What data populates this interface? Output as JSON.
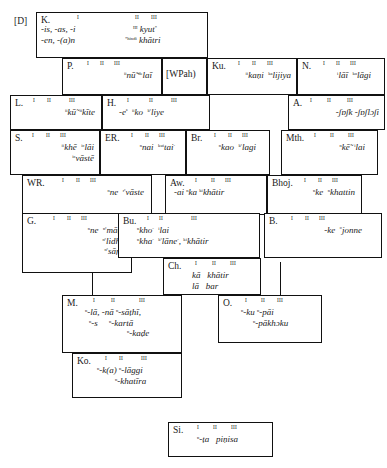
{
  "diagram": {
    "kind": "dialect-continuum-isogloss-chart",
    "column_headings": [
      "I",
      "II",
      "III"
    ],
    "tags": [
      {
        "id": "D",
        "label": "[D]"
      },
      {
        "id": "WPah",
        "label": "[WPah)"
      }
    ],
    "cells": [
      {
        "id": "K",
        "label": "K.",
        "numerals": [
          "I",
          "II",
          "III"
        ],
        "lines": [
          {
            "left": "-is, -as, -i",
            "right_sup": "III",
            "right": "kyut*"
          },
          {
            "left": "-en, -(a)n",
            "right_sup": "=hindi",
            "right": "khātri"
          }
        ]
      },
      {
        "id": "P",
        "label": "P.",
        "numerals": [
          "I",
          "II",
          "III"
        ],
        "lines": [
          {
            "forms": "ⁱⁱnū̃ -ᵈᵉlaī"
          }
        ],
        "forms_plain": "nū̃  -de laī"
      },
      {
        "id": "Ku",
        "label": "Ku.",
        "numerals": [
          "I",
          "II",
          "III"
        ],
        "forms_plain": "ⁱⁱkaṇi  ᵏᵃlijiya"
      },
      {
        "id": "N",
        "label": "N.",
        "numerals": [
          "I",
          "II",
          "III"
        ],
        "forms_plain": "ⁱlāī  ᵏᵒlāgi"
      },
      {
        "id": "L",
        "label": "L.",
        "numerals": [
          "I",
          "II",
          "III"
        ],
        "forms_plain": "ⁱⁱkū̃  ⁱⁱkīte"
      },
      {
        "id": "H",
        "label": "H.",
        "numerals": [
          "I",
          "II",
          "III"
        ],
        "forms_plain": "-eⁿ  ⁱⁱko  ᵏᵉliye"
      },
      {
        "id": "A",
        "label": "A.",
        "numerals": [
          "I",
          "II",
          "III"
        ],
        "forms_plain": "-ʃɒʃk -ʃɒʃlɔʃi"
      },
      {
        "id": "S",
        "label": "S.",
        "numerals": [
          "I",
          "II",
          "III"
        ],
        "lines": [
          {
            "forms": "ⁱⁱkhē  ⁱᶜlāi"
          },
          {
            "forms": "ⁱᶜvāstē"
          }
        ]
      },
      {
        "id": "ER",
        "label": "ER.",
        "numerals": [
          "I",
          "II",
          "III"
        ],
        "forms_plain": "ⁿnai  ᵏᵘⁱtai-"
      },
      {
        "id": "Br",
        "label": "Br.",
        "numerals": [
          "I",
          "II",
          "III"
        ],
        "forms_plain": "ⁿkao  ᵏᶜlagi"
      },
      {
        "id": "Mth",
        "label": "Mth.",
        "numerals": [
          "I",
          "II",
          "III"
        ],
        "forms_plain": "ⁿkē̃  ⁱlai"
      },
      {
        "id": "WR",
        "label": "WR.",
        "numerals": [
          "I",
          "II",
          "III"
        ],
        "forms_plain": "ⁿne  ʳᶜvāste"
      },
      {
        "id": "Aw",
        "label": "Aw.",
        "numerals": [
          "I",
          "II",
          "III"
        ],
        "forms_plain": "-ai  ⁿka ᵏⁱkhātir"
      },
      {
        "id": "Bhoj",
        "label": "Bhoj.",
        "numerals": [
          "I",
          "II",
          "III"
        ],
        "forms_plain": "ⁿke  ⁿkhattin"
      },
      {
        "id": "G",
        "label": "G.",
        "numerals": [
          "I",
          "II",
          "III"
        ],
        "lines": [
          {
            "forms": "ⁿne  ⁿᶜmāṭe"
          },
          {
            "forms": "ⁿᶜlidhe"
          },
          {
            "forms": "ⁿᶜsāṛu"
          }
        ]
      },
      {
        "id": "Bu",
        "label": "Bu.",
        "numerals": [
          "I",
          "II",
          "III"
        ],
        "lines": [
          {
            "forms": "ⁿkho-  ⁿlai"
          },
          {
            "forms": "ⁿkha-  ᵏᶜlāne-, ᵏⁱkhātir"
          }
        ]
      },
      {
        "id": "B",
        "label": "B.",
        "numerals": [
          "I",
          "II",
          "III"
        ],
        "forms_plain": "-ke  ᵉʳjonne"
      },
      {
        "id": "Ch",
        "label": "Ch.",
        "numerals": [
          "I",
          "II",
          "III"
        ],
        "lines": [
          {
            "forms": "kā   khātir"
          },
          {
            "forms": "lā   bar"
          }
        ]
      },
      {
        "id": "M",
        "label": "M.",
        "numerals": [
          "I",
          "II",
          "III"
        ],
        "lines": [
          {
            "forms": "ⁿ-lā, -nā ⁿ-sāṭhī,"
          },
          {
            "forms": "ⁿ-s      ⁿ-kartā"
          },
          {
            "forms": "ⁿ-kaḍe"
          }
        ]
      },
      {
        "id": "O",
        "label": "O.",
        "numerals": [
          "I",
          "II",
          "III"
        ],
        "lines": [
          {
            "forms": "ⁿ-ku ⁿ-pāi"
          },
          {
            "forms": "ⁿ-pākhɔku"
          }
        ]
      },
      {
        "id": "Ko",
        "label": "Ko.",
        "numerals": [
          "I",
          "II",
          "III"
        ],
        "lines": [
          {
            "forms": "ⁿ-k(a) ⁿ-lāggi"
          },
          {
            "forms": "ⁿ-khatīra"
          }
        ]
      },
      {
        "id": "Si",
        "label": "Si.",
        "numerals": [
          "I",
          "II",
          "III"
        ],
        "forms_plain": "ⁿ-ṭa  piṇisa"
      }
    ]
  }
}
